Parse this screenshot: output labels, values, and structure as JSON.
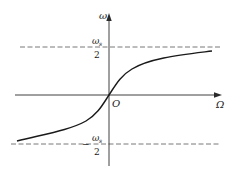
{
  "diagram": {
    "type": "function-graph",
    "axes": {
      "vertical_label": "ω",
      "horizontal_label": "Ω",
      "origin_label": "O"
    },
    "asymptotes": {
      "upper": {
        "numerator": "ω",
        "subscript": "s",
        "denominator": "2",
        "sign": ""
      },
      "lower": {
        "numerator": "ω",
        "subscript": "s",
        "denominator": "2",
        "sign": "−"
      }
    },
    "curve": {
      "shape": "arctangent-like S-curve through origin",
      "approaches_upper": "ωs/2",
      "approaches_lower": "-ωs/2"
    },
    "colors": {
      "curve": "#1a1a1a",
      "axes": "#2a2a2a",
      "asymptotes": "#555555",
      "background": "#ffffff"
    }
  }
}
